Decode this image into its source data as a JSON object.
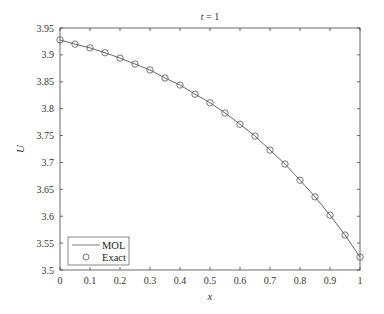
{
  "chart_data": {
    "type": "line",
    "title": "t = 1",
    "title_var": "t",
    "title_rest": " = 1",
    "xlabel": "x",
    "ylabel": "U",
    "xlim": [
      0,
      1
    ],
    "ylim": [
      3.5,
      3.95
    ],
    "xticks": [
      0,
      0.1,
      0.2,
      0.3,
      0.4,
      0.5,
      0.6,
      0.7,
      0.8,
      0.9,
      1
    ],
    "xtick_labels": [
      "0",
      "0.1",
      "0.2",
      "0.3",
      "0.4",
      "0.5",
      "0.6",
      "0.7",
      "0.8",
      "0.9",
      "1"
    ],
    "yticks": [
      3.5,
      3.55,
      3.6,
      3.65,
      3.7,
      3.75,
      3.8,
      3.85,
      3.9,
      3.95
    ],
    "ytick_labels": [
      "3.5",
      "3.55",
      "3.6",
      "3.65",
      "3.7",
      "3.75",
      "3.8",
      "3.85",
      "3.9",
      "3.95"
    ],
    "grid": false,
    "legend_position": "bottom-left",
    "x": [
      0,
      0.05,
      0.1,
      0.15,
      0.2,
      0.25,
      0.3,
      0.35,
      0.4,
      0.45,
      0.5,
      0.55,
      0.6,
      0.65,
      0.7,
      0.75,
      0.8,
      0.85,
      0.9,
      0.95,
      1.0
    ],
    "series": [
      {
        "name": "MOL",
        "style": "line",
        "color": "#555555",
        "values": [
          3.928,
          3.92,
          3.913,
          3.904,
          3.894,
          3.883,
          3.872,
          3.857,
          3.844,
          3.827,
          3.811,
          3.792,
          3.771,
          3.749,
          3.723,
          3.697,
          3.667,
          3.636,
          3.602,
          3.565,
          3.524
        ]
      },
      {
        "name": "Exact",
        "style": "marker-circle",
        "color": "#555555",
        "values": [
          3.928,
          3.92,
          3.913,
          3.904,
          3.894,
          3.883,
          3.872,
          3.857,
          3.844,
          3.827,
          3.811,
          3.792,
          3.771,
          3.749,
          3.723,
          3.697,
          3.667,
          3.636,
          3.602,
          3.565,
          3.524
        ]
      }
    ]
  }
}
